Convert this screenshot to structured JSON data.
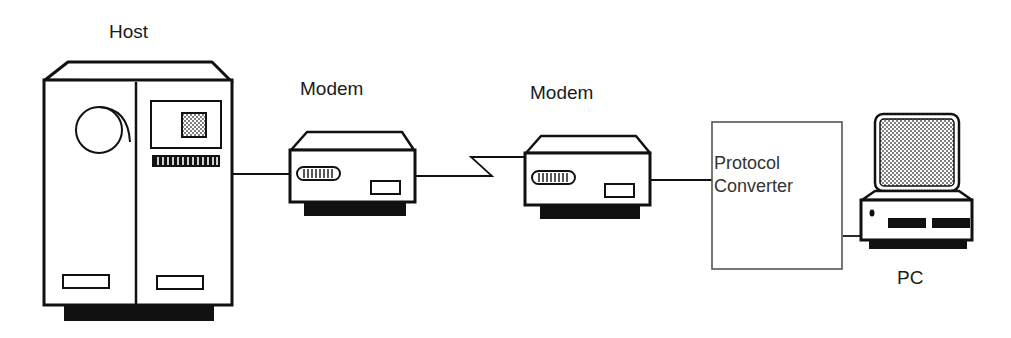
{
  "diagram": {
    "type": "network-topology",
    "nodes": [
      {
        "id": "host",
        "label": "Host"
      },
      {
        "id": "modem1",
        "label": "Modem"
      },
      {
        "id": "modem2",
        "label": "Modem"
      },
      {
        "id": "converter",
        "label_line1": "Protocol",
        "label_line2": "Converter"
      },
      {
        "id": "pc",
        "label": "PC"
      }
    ],
    "edges": [
      {
        "from": "host",
        "to": "modem1",
        "style": "solid"
      },
      {
        "from": "modem1",
        "to": "modem2",
        "style": "telephone-link-zigzag"
      },
      {
        "from": "modem2",
        "to": "converter",
        "style": "solid"
      },
      {
        "from": "converter",
        "to": "pc",
        "style": "solid"
      }
    ]
  },
  "colors": {
    "stroke": "#111111",
    "fill_dark": "#111111",
    "converter_stroke": "#555555",
    "screen_pattern": "#888888"
  }
}
